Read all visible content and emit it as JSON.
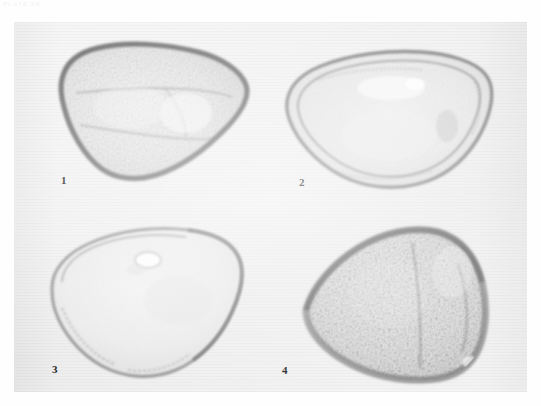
{
  "page": {
    "running_head": "PLATE 24",
    "background_color": "#fefefe"
  },
  "plate": {
    "caption_numbers": [
      "1",
      "2",
      "3",
      "4"
    ],
    "background_color": "#f1f1f1",
    "border_color": "#e9e9e9"
  },
  "specimens": [
    {
      "number": "1",
      "name": "pollen-grain-1",
      "description": "Triangular-obtuse pollen grain, polar view, coarsely granular exine with darker thickened margin",
      "wall_color": "#8a8a8a",
      "body_color": "#e7e7e7",
      "texture": "granular"
    },
    {
      "number": "2",
      "name": "pollen-grain-2",
      "description": "Triangular pollen grain, polar view, smooth lumen with distinct double wall layers and apertural thickenings",
      "wall_color": "#949494",
      "body_color": "#eaeaea",
      "texture": "smooth-layered"
    },
    {
      "number": "3",
      "name": "pollen-grain-3",
      "description": "Rounded-triangular pollen grain, polar view, faint smooth exine with dark narrow outline and small pore",
      "wall_color": "#8f8f8f",
      "body_color": "#ededed",
      "texture": "smooth"
    },
    {
      "number": "4",
      "name": "pollen-grain-4",
      "description": "Triangular pollen grain, polar view, densely reticulate-granular surface, darkest of the four",
      "wall_color": "#6e6e6e",
      "body_color": "#d9d9d9",
      "texture": "reticulate"
    }
  ]
}
